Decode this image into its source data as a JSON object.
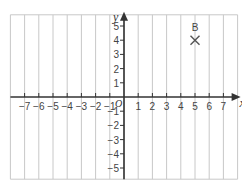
{
  "diagram": {
    "type": "coordinate-grid",
    "x_axis": {
      "label": "x",
      "min": -8,
      "max": 8,
      "tick_labels": [
        "−7",
        "−6",
        "−5",
        "−4",
        "−3",
        "−2",
        "−1",
        "1",
        "2",
        "3",
        "4",
        "5",
        "6",
        "7"
      ],
      "tick_values": [
        -7,
        -6,
        -5,
        -4,
        -3,
        -2,
        -1,
        1,
        2,
        3,
        4,
        5,
        6,
        7
      ]
    },
    "y_axis": {
      "label": "y",
      "min": -6,
      "max": 6,
      "tick_labels": [
        "5",
        "4",
        "3",
        "2",
        "1",
        "−1",
        "−2",
        "−3",
        "−4",
        "−5"
      ],
      "tick_values": [
        5,
        4,
        3,
        2,
        1,
        -1,
        -2,
        -3,
        -4,
        -5
      ]
    },
    "origin_label": "O",
    "points": [
      {
        "label": "B",
        "x": 5,
        "y": 4,
        "marker": "cross"
      }
    ],
    "colors": {
      "grid": "#c8c8c8",
      "axis": "#333333",
      "text": "#444444",
      "marker": "#555555"
    }
  }
}
